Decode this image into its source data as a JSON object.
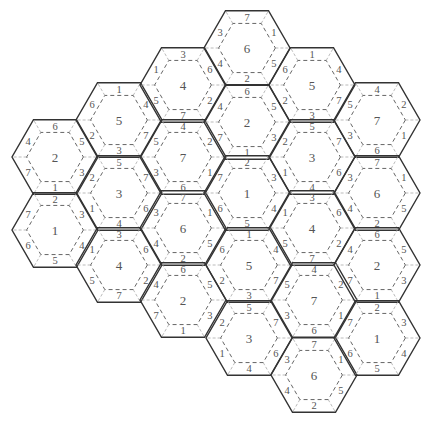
{
  "diagram": {
    "type": "hexagonal-tile-puzzle",
    "tile_radius": 43,
    "inner_scale": 0.66,
    "edge_label_order": [
      "top",
      "upper-right",
      "lower-right",
      "bottom",
      "lower-left",
      "upper-left"
    ],
    "colors": {
      "outer_border": "#333333",
      "inner_dashed": "#666666",
      "spoke_dashed": "#aaaaaa",
      "text": "#555555"
    },
    "tiles": [
      {
        "id": "t1",
        "cx": 55,
        "cy": 157,
        "center": "2",
        "edges": [
          "6",
          "5",
          "3",
          "1",
          "7",
          "4"
        ]
      },
      {
        "id": "t2",
        "cx": 55,
        "cy": 230,
        "center": "1",
        "edges": [
          "2",
          "3",
          "4",
          "5",
          "6",
          "7"
        ]
      },
      {
        "id": "t3",
        "cx": 119,
        "cy": 120,
        "center": "5",
        "edges": [
          "1",
          "4",
          "7",
          "3",
          "2",
          "6"
        ]
      },
      {
        "id": "t4",
        "cx": 119,
        "cy": 193,
        "center": "3",
        "edges": [
          "5",
          "7",
          "6",
          "4",
          "1",
          "2"
        ]
      },
      {
        "id": "t5",
        "cx": 119,
        "cy": 265,
        "center": "4",
        "edges": [
          "3",
          "6",
          "2",
          "7",
          "5",
          "1"
        ]
      },
      {
        "id": "t6",
        "cx": 183,
        "cy": 85,
        "center": "4",
        "edges": [
          "3",
          "6",
          "2",
          "7",
          "5",
          "1"
        ]
      },
      {
        "id": "t7",
        "cx": 183,
        "cy": 157,
        "center": "7",
        "edges": [
          "4",
          "2",
          "1",
          "6",
          "3",
          "5"
        ]
      },
      {
        "id": "t8",
        "cx": 183,
        "cy": 228,
        "center": "6",
        "edges": [
          "7",
          "1",
          "5",
          "2",
          "4",
          "3"
        ]
      },
      {
        "id": "t9",
        "cx": 183,
        "cy": 300,
        "center": "2",
        "edges": [
          "6",
          "5",
          "3",
          "1",
          "7",
          "4"
        ]
      },
      {
        "id": "t10",
        "cx": 247,
        "cy": 48,
        "center": "6",
        "edges": [
          "7",
          "1",
          "5",
          "2",
          "4",
          "3"
        ]
      },
      {
        "id": "t11",
        "cx": 247,
        "cy": 122,
        "center": "2",
        "edges": [
          "6",
          "5",
          "3",
          "1",
          "7",
          "4"
        ]
      },
      {
        "id": "t12",
        "cx": 247,
        "cy": 193,
        "center": "1",
        "edges": [
          "2",
          "3",
          "4",
          "5",
          "6",
          "7"
        ]
      },
      {
        "id": "t13",
        "cx": 249,
        "cy": 265,
        "center": "5",
        "edges": [
          "1",
          "4",
          "7",
          "3",
          "2",
          "6"
        ]
      },
      {
        "id": "t14",
        "cx": 249,
        "cy": 338,
        "center": "3",
        "edges": [
          "5",
          "7",
          "6",
          "4",
          "1",
          "2"
        ]
      },
      {
        "id": "t15",
        "cx": 312,
        "cy": 85,
        "center": "5",
        "edges": [
          "1",
          "4",
          "7",
          "3",
          "2",
          "6"
        ]
      },
      {
        "id": "t16",
        "cx": 312,
        "cy": 157,
        "center": "3",
        "edges": [
          "5",
          "7",
          "6",
          "4",
          "1",
          "2"
        ]
      },
      {
        "id": "t17",
        "cx": 312,
        "cy": 228,
        "center": "4",
        "edges": [
          "3",
          "6",
          "2",
          "7",
          "5",
          "1"
        ]
      },
      {
        "id": "t18",
        "cx": 314,
        "cy": 300,
        "center": "7",
        "edges": [
          "4",
          "2",
          "1",
          "6",
          "3",
          "5"
        ]
      },
      {
        "id": "t19",
        "cx": 314,
        "cy": 375,
        "center": "6",
        "edges": [
          "7",
          "1",
          "5",
          "2",
          "4",
          "3"
        ]
      },
      {
        "id": "t20",
        "cx": 377,
        "cy": 120,
        "center": "7",
        "edges": [
          "4",
          "2",
          "1",
          "6",
          "3",
          "5"
        ]
      },
      {
        "id": "t21",
        "cx": 377,
        "cy": 193,
        "center": "6",
        "edges": [
          "7",
          "1",
          "5",
          "2",
          "4",
          "3"
        ]
      },
      {
        "id": "t22",
        "cx": 377,
        "cy": 265,
        "center": "2",
        "edges": [
          "6",
          "5",
          "3",
          "1",
          "7",
          "4"
        ]
      },
      {
        "id": "t23",
        "cx": 377,
        "cy": 338,
        "center": "1",
        "edges": [
          "2",
          "3",
          "4",
          "5",
          "6",
          "7"
        ]
      }
    ]
  }
}
